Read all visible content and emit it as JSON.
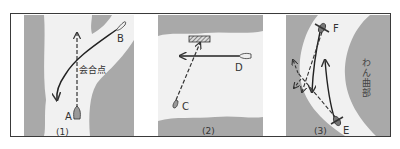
{
  "colors": {
    "land": "#a9a9a9",
    "water": "#f1f1f1",
    "line": "#333333",
    "frame": "#3a3a3a"
  },
  "panels": [
    {
      "number": "(1)",
      "boats": [
        {
          "label": "A",
          "type": "bow-only"
        },
        {
          "label": "B",
          "type": "bow-only"
        }
      ],
      "annotation": "会合点"
    },
    {
      "number": "(2)",
      "boats": [
        {
          "label": "C",
          "type": "bow-only"
        },
        {
          "label": "D",
          "type": "bow-only"
        }
      ],
      "feature": "dock-hatched"
    },
    {
      "number": "(3)",
      "boats": [
        {
          "label": "E",
          "type": "with-oars"
        },
        {
          "label": "F",
          "type": "with-oars"
        }
      ],
      "annotation": "わん曲部"
    }
  ]
}
